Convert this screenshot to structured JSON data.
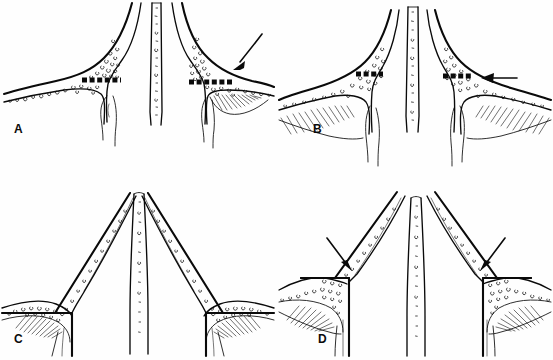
{
  "figure": {
    "background_color": "#ffffff",
    "ink_color": "#0a0a0a",
    "layout": "2x2 grid of line-drawing panels",
    "panel_count": 4
  },
  "panels": [
    {
      "id": "A",
      "label": "A",
      "position": "top-left",
      "description": "Coronal line drawing of nasal septum and lateral walls with a horizontal dashed resection line across each lateral strut; a single arrow at upper right indicates the right-side dashed resection line.",
      "dashed_lines": 2,
      "arrows": [
        {
          "name": "arrow-a-right",
          "direction": "down-left",
          "target": "right dashed resection line"
        }
      ],
      "textures": [
        "stipple",
        "hatching"
      ]
    },
    {
      "id": "B",
      "label": "B",
      "position": "top-right",
      "description": "Narrower, steeper coronal drawing with horizontal dashed resection lines on both lateral struts; a horizontal arrow from the right indicates the right dashed resection line.",
      "dashed_lines": 2,
      "arrows": [
        {
          "name": "arrow-b-right",
          "direction": "left",
          "target": "right dashed resection line"
        }
      ],
      "textures": [
        "stipple",
        "hatching"
      ]
    },
    {
      "id": "C",
      "label": "C",
      "position": "bottom-left",
      "description": "Post-resection result: the lateral struts are cut along solid horizontal lines producing a tall narrow tent-shaped apex; no arrows.",
      "dashed_lines": 0,
      "arrows": [],
      "textures": [
        "stipple",
        "hatching"
      ]
    },
    {
      "id": "D",
      "label": "D",
      "position": "bottom-right",
      "description": "Post-resection result with an open, separated apex; two arrows point down and inward at the stepped cut corners on each side.",
      "dashed_lines": 0,
      "arrows": [
        {
          "name": "arrow-d-left",
          "direction": "down-right",
          "target": "left stepped cut corner"
        },
        {
          "name": "arrow-d-right",
          "direction": "down-left",
          "target": "right stepped cut corner"
        }
      ],
      "textures": [
        "stipple",
        "hatching"
      ]
    }
  ]
}
